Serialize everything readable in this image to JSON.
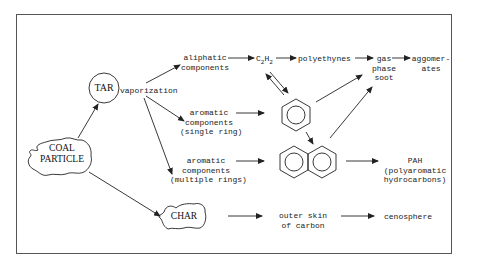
{
  "diagram": {
    "nodes": {
      "coal_particle": "COAL\nPARTICLE",
      "coal_line1": "COAL",
      "coal_line2": "PARTICLE",
      "tar": "TAR",
      "char": "CHAR",
      "vaporization": "vaporization",
      "aliphatic_line1": "aliphatic",
      "aliphatic_line2": "components",
      "c2h2_c": "C",
      "c2h2_sub1": "2",
      "c2h2_h": "H",
      "c2h2_sub2": "2",
      "polyethynes": "polyethynes",
      "gas_line1": "gas",
      "gas_line2": "phase",
      "gas_line3": "soot",
      "agg_line1": "aggomer-",
      "agg_line2": "ates",
      "arom_single_line1": "aromatic",
      "arom_single_line2": "components",
      "arom_single_line3": "(single ring)",
      "arom_multi_line1": "aromatic",
      "arom_multi_line2": "components",
      "arom_multi_line3": "(multiple rings)",
      "pah_line1": "PAH",
      "pah_line2": "(polyaromatic",
      "pah_line3": "hydrocarbons)",
      "skin_line1": "outer skin",
      "skin_line2": "of carbon",
      "cenosphere": "cenosphere"
    },
    "structures": {
      "single_ring": "benzene",
      "double_ring": "naphthalene"
    },
    "colors": {
      "line": "#222222",
      "background": "#ffffff",
      "frame": "#555555"
    }
  }
}
